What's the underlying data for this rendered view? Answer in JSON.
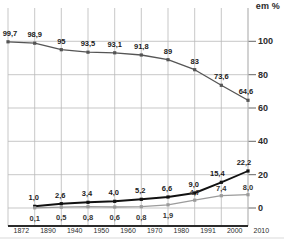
{
  "chart_data": {
    "type": "line",
    "title": "",
    "subtitle": "",
    "xlabel": "",
    "ylabel": "",
    "unit_label": "em %",
    "categories": [
      "1872",
      "1890",
      "1940",
      "1950",
      "1960",
      "1970",
      "1980",
      "1991",
      "2000",
      "2010"
    ],
    "ylim": [
      0,
      108
    ],
    "yticks": [
      0,
      20,
      40,
      60,
      80,
      100
    ],
    "ytick_labels": [
      "0",
      "20",
      "40",
      "60",
      "80",
      "100"
    ],
    "grid": true,
    "legend": "none",
    "series": [
      {
        "name": "upper",
        "color": "#555555",
        "values": [
          99.7,
          98.9,
          95,
          93.5,
          93.1,
          91.8,
          89,
          83,
          73.6,
          64.6
        ],
        "labels": [
          "99,7",
          "98,9",
          "95",
          "93,5",
          "93,1",
          "91,8",
          "89",
          "83",
          "73,6",
          "64,6"
        ]
      },
      {
        "name": "middle",
        "color": "#111111",
        "values": [
          null,
          1.0,
          2.6,
          3.4,
          4.0,
          5.2,
          6.6,
          9.0,
          15.4,
          22.2
        ],
        "labels": [
          "",
          "1,0",
          "2,6",
          "3,4",
          "4,0",
          "5,2",
          "6,6",
          "9,0",
          "15,4",
          "22,2"
        ]
      },
      {
        "name": "lower",
        "color": "#9b9b9b",
        "values": [
          null,
          0.1,
          0.5,
          0.8,
          0.6,
          0.8,
          1.9,
          4.7,
          7.4,
          8.0
        ],
        "labels": [
          "",
          "0,1",
          "0,5",
          "0,8",
          "0,6",
          "0,8",
          "1,9",
          "4,7",
          "7,4",
          "8,0"
        ]
      }
    ]
  },
  "credit": {
    "vertical_note": ""
  }
}
